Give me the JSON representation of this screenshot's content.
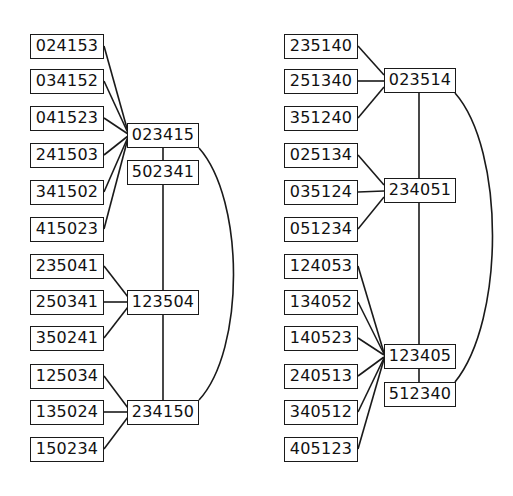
{
  "graphs": [
    {
      "id": "left",
      "leaves": [
        "024153",
        "034152",
        "041523",
        "241503",
        "341502",
        "415023",
        "235041",
        "250341",
        "350241",
        "125034",
        "135024",
        "150234"
      ],
      "hubs": [
        "023415",
        "502341",
        "123504",
        "234150"
      ],
      "edges": [
        [
          "024153",
          "023415"
        ],
        [
          "034152",
          "023415"
        ],
        [
          "041523",
          "023415"
        ],
        [
          "241503",
          "023415"
        ],
        [
          "341502",
          "023415"
        ],
        [
          "415023",
          "023415"
        ],
        [
          "023415",
          "502341"
        ],
        [
          "502341",
          "123504"
        ],
        [
          "123504",
          "234150"
        ],
        [
          "023415",
          "234150"
        ],
        [
          "235041",
          "123504"
        ],
        [
          "250341",
          "123504"
        ],
        [
          "350241",
          "123504"
        ],
        [
          "125034",
          "234150"
        ],
        [
          "135024",
          "234150"
        ],
        [
          "150234",
          "234150"
        ]
      ]
    },
    {
      "id": "right",
      "leaves": [
        "235140",
        "251340",
        "351240",
        "025134",
        "035124",
        "051234",
        "124053",
        "134052",
        "140523",
        "240513",
        "340512",
        "405123"
      ],
      "hubs": [
        "023514",
        "234051",
        "123405",
        "512340"
      ],
      "edges": [
        [
          "235140",
          "023514"
        ],
        [
          "251340",
          "023514"
        ],
        [
          "351240",
          "023514"
        ],
        [
          "025134",
          "234051"
        ],
        [
          "035124",
          "234051"
        ],
        [
          "051234",
          "234051"
        ],
        [
          "023514",
          "234051"
        ],
        [
          "234051",
          "123405"
        ],
        [
          "123405",
          "512340"
        ],
        [
          "023514",
          "512340"
        ],
        [
          "124053",
          "123405"
        ],
        [
          "134052",
          "123405"
        ],
        [
          "140523",
          "123405"
        ],
        [
          "240513",
          "123405"
        ],
        [
          "340512",
          "123405"
        ],
        [
          "405123",
          "123405"
        ]
      ]
    }
  ]
}
